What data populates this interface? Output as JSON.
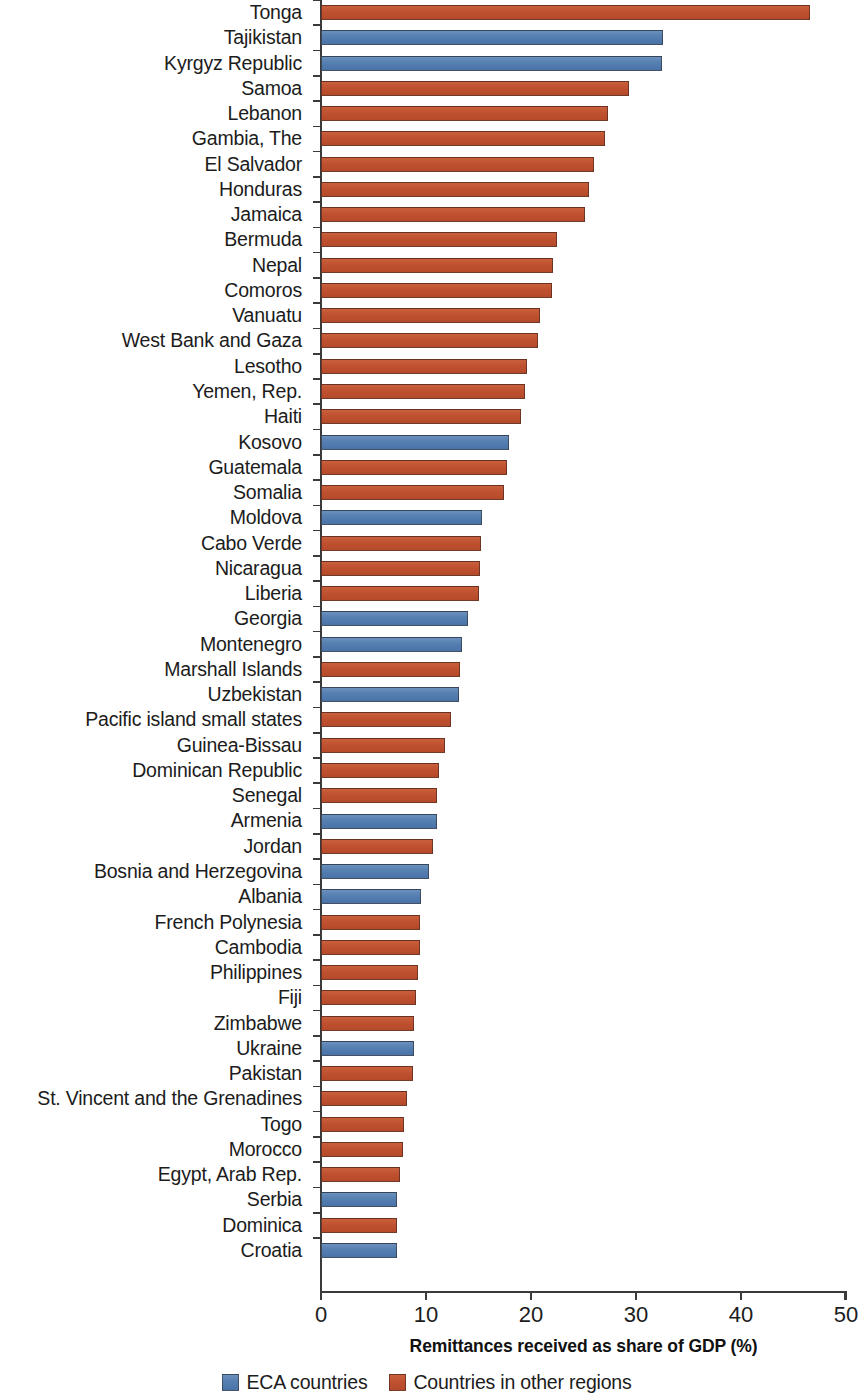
{
  "chart_data": {
    "type": "bar",
    "orientation": "horizontal",
    "title": "",
    "subtitle": "",
    "xlabel": "Remittances received as share of GDP (%)",
    "ylabel": "",
    "xlim": [
      0,
      50
    ],
    "xticks": [
      0,
      10,
      20,
      30,
      40,
      50
    ],
    "xtick_labels": [
      "0",
      "10",
      "20",
      "30",
      "40",
      "50"
    ],
    "grid": false,
    "legend_position": "bottom",
    "series": [
      {
        "name": "ECA countries",
        "color": "#557fb0"
      },
      {
        "name": "Countries in other regions",
        "color": "#bf5130"
      }
    ],
    "categories": [
      "Tonga",
      "Tajikistan",
      "Kyrgyz Republic",
      "Samoa",
      "Lebanon",
      "Gambia, The",
      "El Salvador",
      "Honduras",
      "Jamaica",
      "Bermuda",
      "Nepal",
      "Comoros",
      "Vanuatu",
      "West Bank and Gaza",
      "Lesotho",
      "Yemen, Rep.",
      "Haiti",
      "Kosovo",
      "Guatemala",
      "Somalia",
      "Moldova",
      "Cabo Verde",
      "Nicaragua",
      "Liberia",
      "Georgia",
      "Montenegro",
      "Marshall Islands",
      "Uzbekistan",
      "Pacific island small states",
      "Guinea-Bissau",
      "Dominican Republic",
      "Senegal",
      "Armenia",
      "Jordan",
      "Bosnia and Herzegovina",
      "Albania",
      "French Polynesia",
      "Cambodia",
      "Philippines",
      "Fiji",
      "Zimbabwe",
      "Ukraine",
      "Pakistan",
      "St. Vincent and the Grenadines",
      "Togo",
      "Morocco",
      "Egypt, Arab Rep.",
      "Serbia",
      "Dominica",
      "Croatia"
    ],
    "values": [
      46.6,
      32.6,
      32.5,
      29.3,
      27.3,
      27.0,
      26.0,
      25.5,
      25.1,
      22.5,
      22.1,
      22.0,
      20.9,
      20.7,
      19.6,
      19.4,
      19.0,
      17.9,
      17.7,
      17.4,
      15.3,
      15.2,
      15.1,
      15.0,
      14.0,
      13.4,
      13.2,
      13.1,
      12.4,
      11.8,
      11.2,
      11.0,
      11.0,
      10.7,
      10.3,
      9.5,
      9.4,
      9.4,
      9.2,
      9.0,
      8.9,
      8.9,
      8.8,
      8.2,
      7.9,
      7.8,
      7.5,
      7.2,
      7.2,
      7.2
    ],
    "groups": [
      "other",
      "eca",
      "eca",
      "other",
      "other",
      "other",
      "other",
      "other",
      "other",
      "other",
      "other",
      "other",
      "other",
      "other",
      "other",
      "other",
      "other",
      "eca",
      "other",
      "other",
      "eca",
      "other",
      "other",
      "other",
      "eca",
      "eca",
      "other",
      "eca",
      "other",
      "other",
      "other",
      "other",
      "eca",
      "other",
      "eca",
      "eca",
      "other",
      "other",
      "other",
      "other",
      "other",
      "eca",
      "other",
      "other",
      "other",
      "other",
      "other",
      "eca",
      "other",
      "eca"
    ]
  },
  "legend": {
    "items": [
      {
        "label": "ECA countries",
        "group": "eca"
      },
      {
        "label": "Countries in other regions",
        "group": "other"
      }
    ]
  },
  "axis": {
    "x_title": "Remittances received as share of GDP (%)"
  },
  "colors": {
    "eca": "#557fb0",
    "other": "#bf5130",
    "axis": "#3a3a3a",
    "text": "#1c1c1c",
    "background": "#ffffff"
  }
}
